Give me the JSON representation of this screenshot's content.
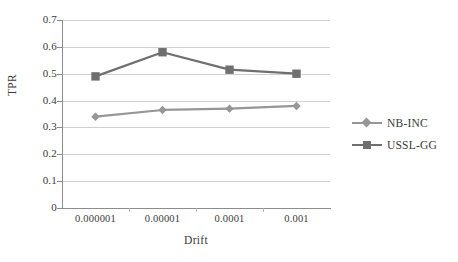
{
  "chart_data": {
    "type": "line",
    "title": "",
    "xlabel": "Drift",
    "ylabel": "TPR",
    "categories": [
      "0.000001",
      "0.00001",
      "0.0001",
      "0.001"
    ],
    "ylim": [
      0,
      0.7
    ],
    "yticks": [
      "0",
      "0.1",
      "0.2",
      "0.3",
      "0.4",
      "0.5",
      "0.6",
      "0.7"
    ],
    "ytick_values": [
      0,
      0.1,
      0.2,
      0.3,
      0.4,
      0.5,
      0.6,
      0.7
    ],
    "grid": true,
    "legend_position": "right",
    "series": [
      {
        "name": "NB-INC",
        "values": [
          0.34,
          0.365,
          0.37,
          0.38
        ],
        "color": "#969696",
        "marker": "diamond"
      },
      {
        "name": "USSL-GG",
        "values": [
          0.49,
          0.58,
          0.515,
          0.5
        ],
        "color": "#6f6f6f",
        "marker": "square"
      }
    ]
  },
  "colors": {
    "axis": "#8c8c8c",
    "grid": "#d0d0d0",
    "text": "#3a3a3a",
    "background": "#ffffff"
  }
}
